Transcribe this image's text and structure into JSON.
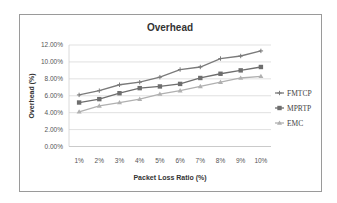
{
  "chart_data": {
    "type": "line",
    "title": "Overhead",
    "xlabel": "Packet Loss Ratio (%)",
    "ylabel": "Overhead (%)",
    "categories": [
      "1%",
      "2%",
      "3%",
      "4%",
      "5%",
      "6%",
      "7%",
      "8%",
      "9%",
      "10%"
    ],
    "yticks": [
      "0.00%",
      "2.00%",
      "4.00%",
      "6.00%",
      "8.00%",
      "10.00%",
      "12.00%"
    ],
    "ylim": [
      0,
      12
    ],
    "grid": true,
    "legend_position": "right",
    "series": [
      {
        "name": "FMTCP",
        "marker": "plus",
        "color": "#7a7a7a",
        "values": [
          6.1,
          6.6,
          7.3,
          7.6,
          8.2,
          9.1,
          9.4,
          10.4,
          10.7,
          11.3
        ]
      },
      {
        "name": "MPRTP",
        "marker": "square",
        "color": "#6e6e6e",
        "values": [
          5.2,
          5.6,
          6.3,
          6.9,
          7.1,
          7.4,
          8.1,
          8.6,
          9.0,
          9.4
        ]
      },
      {
        "name": "EMC",
        "marker": "triangle",
        "color": "#b0b0b0",
        "values": [
          4.1,
          4.8,
          5.2,
          5.6,
          6.2,
          6.6,
          7.1,
          7.6,
          8.1,
          8.3
        ]
      }
    ]
  }
}
